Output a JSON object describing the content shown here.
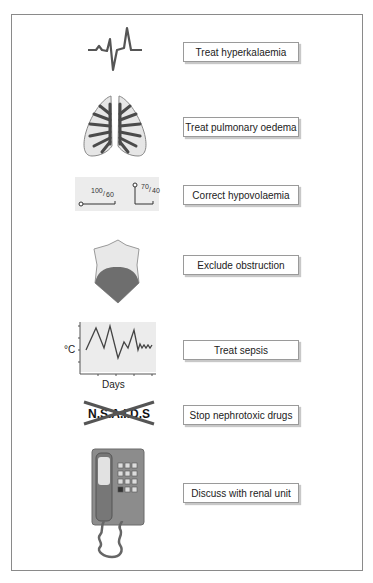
{
  "diagram": {
    "items": [
      {
        "icon": "ecg-trace-icon",
        "label": "Treat hyperkalaemia"
      },
      {
        "icon": "lungs-icon",
        "label": "Treat pulmonary oedema"
      },
      {
        "icon": "blood-pressure-drop-icon",
        "label": "Correct hypovolaemia",
        "bp_before": "100/60",
        "bp_before_num": "100",
        "bp_before_den": "60",
        "bp_after_num": "70",
        "bp_after_den": "40"
      },
      {
        "icon": "bladder-obstruction-icon",
        "label": "Exclude obstruction"
      },
      {
        "icon": "temperature-chart-icon",
        "label": "Treat sepsis",
        "ylabel": "°C",
        "xlabel": "Days"
      },
      {
        "icon": "crossed-nsaids-icon",
        "label": "Stop nephrotoxic drugs",
        "drug_text": "N.S.A.I.D.S"
      },
      {
        "icon": "telephone-icon",
        "label": "Discuss with renal unit"
      }
    ]
  },
  "colors": {
    "stroke": "#555555",
    "lung_fill": "#e6e6e6",
    "dark_fill": "#4a4a4a",
    "panel_fill": "#ececec",
    "phone_body": "#8c8c8c"
  }
}
